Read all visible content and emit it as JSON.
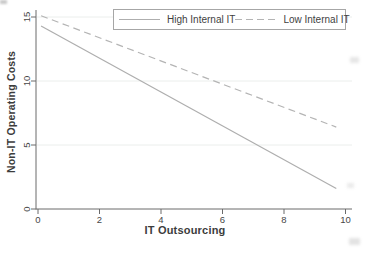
{
  "chart_data": {
    "type": "line",
    "title": "",
    "xlabel": "IT Outsourcing",
    "ylabel": "Non-IT Operating Costs",
    "xlim": [
      -0.1,
      10.2
    ],
    "ylim": [
      0,
      15.6
    ],
    "xticks": [
      0,
      2,
      4,
      6,
      8,
      10
    ],
    "yticks": [
      0,
      5,
      10,
      15
    ],
    "grid": "horizontal gridlines at major y ticks, very light",
    "legend_position": "top-center, boxed, horizontal",
    "series": [
      {
        "name": "High Internal IT",
        "style": "solid",
        "color": "#aeaeae",
        "x": [
          0.1,
          9.7
        ],
        "y": [
          14.3,
          1.6
        ]
      },
      {
        "name": "Low Internal IT",
        "style": "dashed",
        "color": "#b4b4b4",
        "x": [
          0.1,
          9.7
        ],
        "y": [
          15.1,
          6.4
        ]
      }
    ]
  },
  "colors": {
    "background": "#ffffff",
    "axis": "#6a6a6a",
    "tick_text": "#474747",
    "title_text": "#3c3c3c",
    "gridline": "#ebeeec",
    "legend_border": "#a6a6a6"
  }
}
